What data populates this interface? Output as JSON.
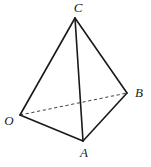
{
  "figure": {
    "kind": "tetrahedron-line-drawing",
    "background_color": "#ffffff",
    "solid_edge_color": "#191919",
    "dashed_edge_color": "#4a4a4a",
    "label_color": "#1a1a1a",
    "vertices": {
      "C": {
        "label": "C",
        "x": 75,
        "y": 18,
        "label_x": 78,
        "label_y": 9
      },
      "O": {
        "label": "O",
        "x": 20,
        "y": 115,
        "label_x": 9,
        "label_y": 122
      },
      "B": {
        "label": "B",
        "x": 127,
        "y": 93,
        "label_x": 139,
        "label_y": 94
      },
      "A": {
        "label": "A",
        "x": 83,
        "y": 141,
        "label_x": 84,
        "label_y": 154
      }
    },
    "edges": [
      {
        "name": "edge-C-O",
        "from": "C",
        "to": "O",
        "style": "solid"
      },
      {
        "name": "edge-C-B",
        "from": "C",
        "to": "B",
        "style": "solid"
      },
      {
        "name": "edge-C-A",
        "from": "C",
        "to": "A",
        "style": "solid"
      },
      {
        "name": "edge-O-A",
        "from": "O",
        "to": "A",
        "style": "solid"
      },
      {
        "name": "edge-A-B",
        "from": "A",
        "to": "B",
        "style": "solid"
      },
      {
        "name": "edge-O-B",
        "from": "O",
        "to": "B",
        "style": "dashed"
      }
    ]
  }
}
